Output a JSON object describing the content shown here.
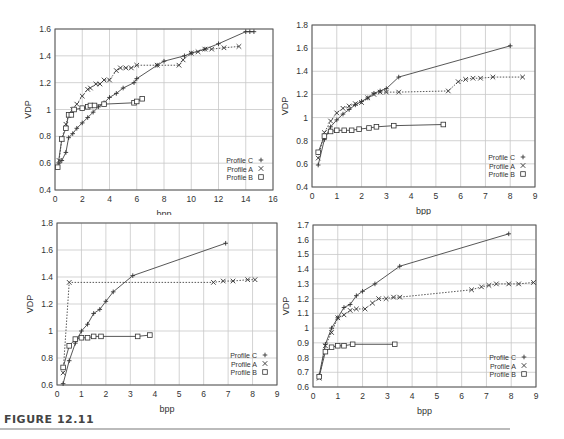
{
  "caption": "FIGURE 12.11",
  "chart_data": [
    {
      "type": "line",
      "title": "",
      "xlabel": "bpp",
      "ylabel": "VDP",
      "xlim": [
        0,
        16
      ],
      "ylim": [
        0.4,
        1.6
      ],
      "xticks": [
        0,
        2,
        4,
        6,
        8,
        10,
        12,
        14,
        16
      ],
      "yticks": [
        0.4,
        0.6,
        0.8,
        1,
        1.2,
        1.4,
        1.6
      ],
      "grid": true,
      "legend_position": "lower right",
      "box": {
        "left": 55,
        "top": 29,
        "width": 218,
        "height": 161
      },
      "series": [
        {
          "name": "Profile C",
          "marker": "+",
          "dash": "solid",
          "x": [
            0.3,
            0.5,
            0.8,
            1.0,
            1.3,
            1.6,
            2.0,
            2.4,
            2.8,
            3.2,
            3.6,
            4.0,
            4.5,
            5.0,
            5.8,
            6.0,
            7.5,
            8.0,
            9.5,
            10.0,
            11.0,
            12.0,
            14.0,
            14.3,
            14.6
          ],
          "y": [
            0.6,
            0.62,
            0.68,
            0.79,
            0.82,
            0.86,
            0.9,
            0.94,
            0.98,
            1.02,
            1.05,
            1.09,
            1.12,
            1.16,
            1.2,
            1.23,
            1.33,
            1.36,
            1.4,
            1.42,
            1.45,
            1.49,
            1.58,
            1.58,
            1.58
          ]
        },
        {
          "name": "Profile A",
          "marker": "x",
          "dash": "dotted",
          "x": [
            0.3,
            0.5,
            0.8,
            1.0,
            1.3,
            1.6,
            2.0,
            2.4,
            2.6,
            3.0,
            3.3,
            3.6,
            4.0,
            4.5,
            4.8,
            5.2,
            5.6,
            6.0,
            7.5,
            9.1,
            9.4,
            10.0,
            10.5,
            11.0,
            11.5,
            12.4,
            13.5
          ],
          "y": [
            0.62,
            0.78,
            0.89,
            0.96,
            1.0,
            1.04,
            1.1,
            1.15,
            1.16,
            1.19,
            1.19,
            1.22,
            1.22,
            1.29,
            1.31,
            1.31,
            1.31,
            1.33,
            1.33,
            1.33,
            1.37,
            1.42,
            1.43,
            1.45,
            1.45,
            1.46,
            1.47
          ]
        },
        {
          "name": "Profile B",
          "marker": "square",
          "dash": "solid",
          "x": [
            0.2,
            0.5,
            0.8,
            1.0,
            1.2,
            1.4,
            2.0,
            2.4,
            2.6,
            2.9,
            3.6,
            5.8,
            6.0,
            6.4
          ],
          "y": [
            0.57,
            0.78,
            0.86,
            0.96,
            0.96,
            1.0,
            1.01,
            1.02,
            1.03,
            1.03,
            1.04,
            1.05,
            1.06,
            1.08
          ]
        }
      ]
    },
    {
      "type": "line",
      "title": "",
      "xlabel": "bpp",
      "ylabel": "VDP",
      "xlim": [
        0,
        9
      ],
      "ylim": [
        0.4,
        1.8
      ],
      "xticks": [
        0,
        1,
        2,
        3,
        4,
        5,
        6,
        7,
        8,
        9
      ],
      "yticks": [
        0.4,
        0.6,
        0.8,
        1,
        1.2,
        1.4,
        1.6,
        1.8
      ],
      "grid": true,
      "legend_position": "lower right",
      "box": {
        "left": 312,
        "top": 25,
        "width": 223,
        "height": 162
      },
      "series": [
        {
          "name": "Profile C",
          "marker": "+",
          "dash": "solid",
          "x": [
            0.25,
            0.5,
            0.75,
            1.0,
            1.25,
            1.5,
            1.75,
            2.0,
            2.25,
            2.5,
            2.75,
            3.0,
            3.5,
            8.0
          ],
          "y": [
            0.59,
            0.81,
            0.92,
            0.98,
            1.03,
            1.07,
            1.11,
            1.14,
            1.17,
            1.21,
            1.23,
            1.25,
            1.35,
            1.62
          ]
        },
        {
          "name": "Profile A",
          "marker": "x",
          "dash": "dotted",
          "x": [
            0.25,
            0.5,
            0.75,
            1.0,
            1.25,
            1.5,
            1.75,
            2.0,
            2.25,
            2.5,
            2.75,
            3.0,
            3.5,
            5.5,
            5.9,
            6.2,
            6.5,
            6.8,
            7.3,
            8.5
          ],
          "y": [
            0.65,
            0.87,
            0.97,
            1.04,
            1.08,
            1.1,
            1.12,
            1.13,
            1.17,
            1.2,
            1.22,
            1.22,
            1.22,
            1.23,
            1.31,
            1.33,
            1.34,
            1.34,
            1.35,
            1.35
          ]
        },
        {
          "name": "Profile B",
          "marker": "square",
          "dash": "solid",
          "x": [
            0.25,
            0.5,
            0.75,
            1.0,
            1.3,
            1.6,
            1.9,
            2.3,
            2.6,
            3.3,
            5.3
          ],
          "y": [
            0.7,
            0.84,
            0.88,
            0.89,
            0.89,
            0.89,
            0.9,
            0.91,
            0.92,
            0.93,
            0.94
          ]
        }
      ]
    },
    {
      "type": "line",
      "title": "",
      "xlabel": "bpp",
      "ylabel": "VDP",
      "xlim": [
        0,
        9
      ],
      "ylim": [
        0.6,
        1.8
      ],
      "xticks": [
        0,
        1,
        2,
        3,
        4,
        5,
        6,
        7,
        8,
        9
      ],
      "yticks": [
        0.6,
        0.8,
        1,
        1.2,
        1.4,
        1.6,
        1.8
      ],
      "grid": true,
      "legend_position": "lower right",
      "box": {
        "left": 57,
        "top": 223,
        "width": 220,
        "height": 162
      },
      "series": [
        {
          "name": "Profile C",
          "marker": "+",
          "dash": "solid",
          "x": [
            0.25,
            0.5,
            0.75,
            1.0,
            1.25,
            1.5,
            1.75,
            2.0,
            2.3,
            3.1,
            6.9
          ],
          "y": [
            0.61,
            0.78,
            0.91,
            1.0,
            1.05,
            1.13,
            1.16,
            1.22,
            1.29,
            1.41,
            1.65
          ]
        },
        {
          "name": "Profile A",
          "marker": "x",
          "dash": "dotted",
          "x": [
            0.25,
            0.5,
            6.4,
            6.8,
            7.2,
            7.8,
            8.1
          ],
          "y": [
            0.69,
            1.36,
            1.36,
            1.37,
            1.37,
            1.38,
            1.38
          ]
        },
        {
          "name": "Profile B",
          "marker": "square",
          "dash": "solid",
          "x": [
            0.25,
            0.5,
            0.75,
            1.0,
            1.25,
            1.5,
            1.8,
            3.3,
            3.8
          ],
          "y": [
            0.73,
            0.89,
            0.94,
            0.95,
            0.95,
            0.96,
            0.96,
            0.96,
            0.97
          ]
        }
      ]
    },
    {
      "type": "line",
      "title": "",
      "xlabel": "bpp",
      "ylabel": "VDP",
      "xlim": [
        0,
        9
      ],
      "ylim": [
        0.6,
        1.7
      ],
      "xticks": [
        0,
        1,
        2,
        3,
        4,
        5,
        6,
        7,
        8,
        9
      ],
      "yticks": [
        0.6,
        0.7,
        0.8,
        0.9,
        1,
        1.1,
        1.2,
        1.3,
        1.4,
        1.5,
        1.6,
        1.7
      ],
      "grid": true,
      "legend_position": "lower right",
      "box": {
        "left": 313,
        "top": 225,
        "width": 223,
        "height": 162
      },
      "series": [
        {
          "name": "Profile C",
          "marker": "+",
          "dash": "solid",
          "x": [
            0.25,
            0.5,
            0.75,
            1.0,
            1.25,
            1.5,
            1.75,
            2.0,
            2.5,
            3.5,
            7.9
          ],
          "y": [
            0.68,
            0.89,
            1.0,
            1.07,
            1.14,
            1.16,
            1.22,
            1.25,
            1.3,
            1.42,
            1.64
          ]
        },
        {
          "name": "Profile A",
          "marker": "x",
          "dash": "dotted",
          "x": [
            0.25,
            0.5,
            0.75,
            1.0,
            1.25,
            1.5,
            1.75,
            2.1,
            2.4,
            2.65,
            2.95,
            3.25,
            3.5,
            6.4,
            6.8,
            7.1,
            7.4,
            7.9,
            8.3,
            8.9
          ],
          "y": [
            0.66,
            0.88,
            0.97,
            1.07,
            1.09,
            1.12,
            1.13,
            1.13,
            1.17,
            1.2,
            1.2,
            1.21,
            1.21,
            1.26,
            1.28,
            1.29,
            1.3,
            1.3,
            1.3,
            1.31
          ]
        },
        {
          "name": "Profile B",
          "marker": "square",
          "dash": "solid",
          "x": [
            0.25,
            0.5,
            0.75,
            1.0,
            1.25,
            1.6,
            3.3
          ],
          "y": [
            0.67,
            0.84,
            0.87,
            0.88,
            0.88,
            0.89,
            0.89
          ]
        }
      ]
    }
  ]
}
